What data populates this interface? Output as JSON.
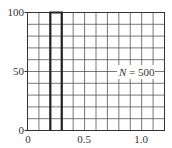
{
  "chart_data": {
    "type": "bar",
    "title": "",
    "xlabel": "",
    "ylabel": "",
    "bins": [
      {
        "x0": 0.2,
        "x1": 0.3,
        "value": 100
      }
    ],
    "categories": [
      "0.2-0.3"
    ],
    "values": [
      100
    ],
    "xlim": [
      0,
      1.2
    ],
    "ylim": [
      0,
      100
    ],
    "x_ticks": [
      "0",
      "0.5",
      "1.0"
    ],
    "y_ticks": [
      "0",
      "50",
      "100"
    ],
    "grid": true,
    "grid_x_step": 0.1,
    "grid_y_step": 10,
    "annotation": "N = 500"
  },
  "labels": {
    "y0": "0",
    "y50": "50",
    "y100": "100",
    "x0": "0",
    "x05": "0.5",
    "x10": "1.0",
    "n_italic": "N",
    "n_rest": " = 500"
  }
}
